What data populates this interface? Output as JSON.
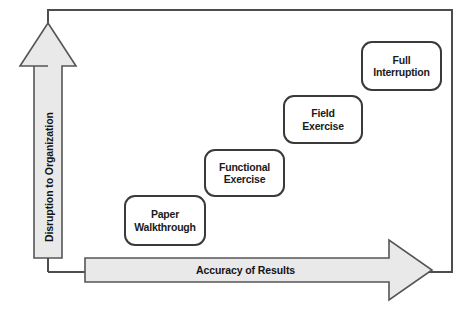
{
  "diagram": {
    "type": "quadrant-progression",
    "title": "",
    "axes": {
      "vertical": {
        "label": "Disruption to Organization",
        "direction": "up",
        "arrow_icon": "up-arrow-icon"
      },
      "horizontal": {
        "label": "Accuracy of Results",
        "direction": "right",
        "arrow_icon": "right-arrow-icon"
      }
    },
    "stages": [
      {
        "id": "paper-walkthrough",
        "line1": "Paper",
        "line2": "Walkthrough"
      },
      {
        "id": "functional-exercise",
        "line1": "Functional",
        "line2": "Exercise"
      },
      {
        "id": "field-exercise",
        "line1": "Field",
        "line2": "Exercise"
      },
      {
        "id": "full-interruption",
        "line1": "Full",
        "line2": "Interruption"
      }
    ],
    "colors": {
      "arrow_fill": "#e9e9e9",
      "arrow_stroke": "#555555",
      "box_fill": "#ffffff",
      "box_stroke": "#3a3a3a",
      "frame_stroke": "#4d4d4d",
      "text": "#141414",
      "background": "#ffffff"
    }
  }
}
